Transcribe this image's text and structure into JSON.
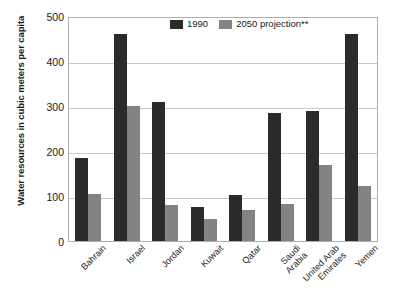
{
  "chart_data": {
    "type": "bar",
    "title": "",
    "xlabel": "",
    "ylabel": "Water resources in cubic meters per capita",
    "ylim": [
      0,
      500
    ],
    "yticks": [
      0,
      100,
      200,
      300,
      400,
      500
    ],
    "ytick_labels": [
      "0",
      "100",
      "200",
      "300",
      "400",
      "500"
    ],
    "grid": true,
    "legend_position": "top-center",
    "categories": [
      "Bahrain",
      "Israel",
      "Jordan",
      "Kuwait",
      "Qatar",
      "Saudi\nArabia",
      "United Arab\nEmirates",
      "Yemen"
    ],
    "series": [
      {
        "name": "1990",
        "color": "#2b2b2b",
        "values": [
          185,
          460,
          308,
          75,
          103,
          285,
          290,
          460
        ]
      },
      {
        "name": "2050 projection**",
        "color": "#838383",
        "values": [
          105,
          300,
          80,
          50,
          68,
          83,
          170,
          122
        ]
      }
    ]
  },
  "legend": {
    "items": [
      {
        "label": "1990",
        "swatch": "dark-square-swatch"
      },
      {
        "label": "2050 projection**",
        "swatch": "gray-square-swatch"
      }
    ]
  },
  "axis": {
    "y_title": "Water resources in cubic meters per capita",
    "y_tick_labels": [
      "500",
      "400",
      "300",
      "200",
      "100",
      "0"
    ],
    "x_tick_labels": [
      "Bahrain",
      "Israel",
      "Jordan",
      "Kuwait",
      "Qatar",
      "Saudi Arabia",
      "United Arab Emirates",
      "Yemen"
    ],
    "x_tick_lines": [
      [
        "Bahrain"
      ],
      [
        "Israel"
      ],
      [
        "Jordan"
      ],
      [
        "Kuwait"
      ],
      [
        "Qatar"
      ],
      [
        "Saudi",
        "Arabia"
      ],
      [
        "United Arab",
        "Emirates"
      ],
      [
        "Yemen"
      ]
    ]
  },
  "colors": {
    "series_1": "#2b2b2b",
    "series_2": "#838383",
    "grid": "#c9c9c9",
    "frame": "#aeaeae",
    "text": "#1a1a1a",
    "background": "#ffffff"
  }
}
